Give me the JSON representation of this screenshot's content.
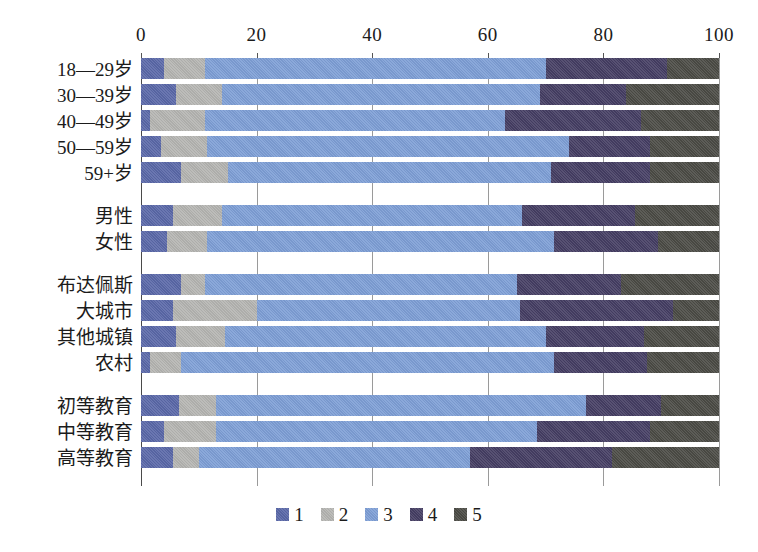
{
  "chart_data": {
    "type": "bar",
    "orientation": "horizontal",
    "stacked": true,
    "stack_total": 100,
    "title": "",
    "subtitle": "",
    "xlabel": "",
    "ylabel": "",
    "xlim": [
      0,
      100
    ],
    "xticks": [
      0,
      20,
      40,
      60,
      80,
      100
    ],
    "xtick_labels": [
      "0",
      "20",
      "40",
      "60",
      "80",
      "100"
    ],
    "grid": true,
    "grid_axis": "x",
    "legend_position": "bottom",
    "legend_entries": [
      "1",
      "2",
      "3",
      "4",
      "5"
    ],
    "series": [
      {
        "name": "1",
        "color": "#5a68a8",
        "values": [
          4,
          6,
          1.5,
          3.5,
          7,
          5.5,
          4.5,
          7,
          5.5,
          6,
          1.5,
          6.5,
          4,
          5.5
        ]
      },
      {
        "name": "2",
        "color": "#b5b5b2",
        "values": [
          7,
          8,
          9.5,
          8,
          8,
          8.5,
          7,
          4,
          14.5,
          8.5,
          5.5,
          6.5,
          9,
          4.5
        ]
      },
      {
        "name": "3",
        "color": "#7e9fd6",
        "values": [
          59,
          55,
          52,
          62.5,
          56,
          52,
          60,
          47,
          45.5,
          56,
          64.5,
          64,
          51.5,
          47
        ]
      },
      {
        "name": "4",
        "color": "#453e63",
        "values": [
          21,
          15,
          23.5,
          14,
          17,
          19.5,
          18,
          18,
          26.5,
          17,
          16,
          13,
          19.5,
          24.5
        ]
      },
      {
        "name": "5",
        "color": "#4b4b45",
        "values": [
          9,
          16,
          13.5,
          12,
          12,
          14.5,
          10.5,
          24,
          8,
          13,
          12.5,
          10,
          16,
          18.5
        ]
      }
    ],
    "categories": [
      "18—29岁",
      "30—39岁",
      "40—49岁",
      "50—59岁",
      "59+岁",
      "男性",
      "女性",
      "布达佩斯",
      "大城市",
      "其他城镇",
      "农村",
      "初等教育",
      "中等教育",
      "高等教育"
    ],
    "category_groups": [
      {
        "name": "age",
        "categories": [
          "18—29岁",
          "30—39岁",
          "40—49岁",
          "50—59岁",
          "59+岁"
        ]
      },
      {
        "name": "gender",
        "categories": [
          "男性",
          "女性"
        ]
      },
      {
        "name": "settlement",
        "categories": [
          "布达佩斯",
          "大城市",
          "其他城镇",
          "农村"
        ]
      },
      {
        "name": "education",
        "categories": [
          "初等教育",
          "中等教育",
          "高等教育"
        ]
      }
    ],
    "rows": [
      {
        "label": "18—29岁",
        "group": "age",
        "values": [
          4,
          7,
          59,
          21,
          9
        ]
      },
      {
        "label": "30—39岁",
        "group": "age",
        "values": [
          6,
          8,
          55,
          15,
          16
        ]
      },
      {
        "label": "40—49岁",
        "group": "age",
        "values": [
          1.5,
          9.5,
          52,
          23.5,
          13.5
        ]
      },
      {
        "label": "50—59岁",
        "group": "age",
        "values": [
          3.5,
          8,
          62.5,
          14,
          12
        ]
      },
      {
        "label": "59+岁",
        "group": "age",
        "values": [
          7,
          8,
          56,
          17,
          12
        ]
      },
      {
        "label": "男性",
        "group": "gender",
        "values": [
          5.5,
          8.5,
          52,
          19.5,
          14.5
        ]
      },
      {
        "label": "女性",
        "group": "gender",
        "values": [
          4.5,
          7,
          60,
          18,
          10.5
        ]
      },
      {
        "label": "布达佩斯",
        "group": "settlement",
        "values": [
          7,
          4,
          54,
          18,
          17
        ]
      },
      {
        "label": "大城市",
        "group": "settlement",
        "values": [
          5.5,
          14.5,
          45.5,
          26.5,
          8
        ]
      },
      {
        "label": "其他城镇",
        "group": "settlement",
        "values": [
          6,
          8.5,
          55.5,
          17,
          13
        ]
      },
      {
        "label": "农村",
        "group": "settlement",
        "values": [
          1.5,
          5.5,
          64.5,
          16,
          12.5
        ]
      },
      {
        "label": "初等教育",
        "group": "education",
        "values": [
          6.5,
          6.5,
          64,
          13,
          10
        ]
      },
      {
        "label": "中等教育",
        "group": "education",
        "values": [
          4,
          9,
          55.5,
          19.5,
          12
        ]
      },
      {
        "label": "高等教育",
        "group": "education",
        "values": [
          5.5,
          4.5,
          47,
          24.5,
          18.5
        ]
      }
    ]
  },
  "legend": {
    "items": [
      {
        "label": "1",
        "color": "#5a68a8"
      },
      {
        "label": "2",
        "color": "#b5b5b2"
      },
      {
        "label": "3",
        "color": "#7e9fd6"
      },
      {
        "label": "4",
        "color": "#453e63"
      },
      {
        "label": "5",
        "color": "#4b4b45"
      }
    ]
  },
  "axis": {
    "x_tick_labels": [
      "0",
      "20",
      "40",
      "60",
      "80",
      "100"
    ]
  }
}
